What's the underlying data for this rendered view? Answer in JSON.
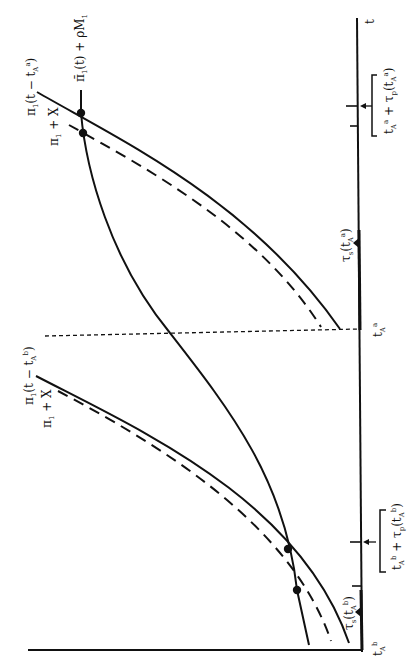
{
  "figure": {
    "orientation": "rotated 90 degrees counterclockwise",
    "axis": {
      "time_label": "t"
    },
    "curves": [
      {
        "id": "pi1_shift_a",
        "label": "π₁(t − tₐᵃ)",
        "style": "solid"
      },
      {
        "id": "pi1_plus_x_a",
        "label": "π₁ + X",
        "style": "dashed"
      },
      {
        "id": "pibar_rhoM",
        "label": "π̄₁(t) + ρM₁",
        "style": "solid"
      },
      {
        "id": "pi1_shift_b",
        "label": "π₁(t − tₐᵇ)",
        "style": "solid"
      },
      {
        "id": "pi1_plus_x_b",
        "label": "π₁ + X",
        "style": "dashed"
      }
    ],
    "tick_labels": {
      "t_A_b": "tₐᵇ",
      "t_A_a": "tₐᵃ",
      "tau_s_b": "τₛ(tₐᵇ)",
      "tau_s_a": "τₛ(tₐᵃ)",
      "bracket_b": "tₐᵇ + τₚ(tₐᵇ)",
      "bracket_a": "tₐᵃ + τₚ(tₐᵃ)"
    },
    "text": {
      "t": "t",
      "pi1_shift_a_main": "π",
      "pi1_shift_a_rest": "(t − t",
      "pibar_main": "π̄",
      "pibar_rest": "(t) + ρM",
      "pi_plus_x": "+ X",
      "pi1_shift_b_rest": "(t − t",
      "tau": "τ",
      "bracket_plus": " + τ",
      "sub1": "1",
      "subA": "A",
      "supa": "a",
      "supb": "b",
      "subs": "s",
      "subp": "p",
      "lparen": "(t",
      "rparen": ")",
      "close": ")"
    },
    "intersection_points": 4
  }
}
